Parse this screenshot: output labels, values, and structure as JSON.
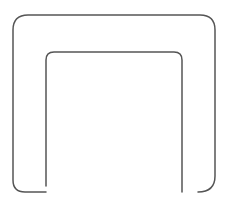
{
  "canvas": {
    "width": 228,
    "height": 205,
    "background": "#ffffff"
  },
  "shape": {
    "label": "U-shaped outline (inverted, open-ended channel)",
    "stroke_color": "#555555",
    "stroke_width": 1.5,
    "outer_path": "M 46 192 L 25 192 Q 13 192 13 180 L 13 30 Q 13 15 28 15 L 200 15 Q 215 15 215 30 L 215 176 Q 215 192 198 192",
    "inner_path": "M 46 186 L 46 60 Q 46 52 54 52 L 174 52 Q 182 52 182 60 L 182 192"
  }
}
